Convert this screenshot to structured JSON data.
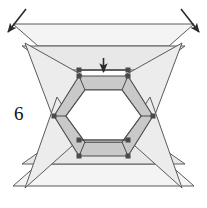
{
  "figure": {
    "label": "6",
    "colors": {
      "background": "#ffffff",
      "stroke": "#555555",
      "stroke_dark": "#3a3a3a",
      "fill_light": "#ebebeb",
      "fill_mid": "#d9d9d9",
      "fill_band": "#c9c9c9",
      "fill_white": "#ffffff",
      "arrow": "#2b2b2b",
      "vertex": "#4a4a4a",
      "label": "#111111"
    },
    "annotations": {
      "arrow_down": "down-arrow",
      "arrow_top_left": "diagonal-arrow-down-left",
      "arrow_top_right": "diagonal-arrow-down-right"
    },
    "geometry": {
      "outer_top_band": {
        "name": "top-outer-trapezoid-band",
        "points": "13,24 194,24 169,46 38,46",
        "fill": "#f2f2f2"
      },
      "top_band": {
        "name": "top-trapezoid-band",
        "points": "22,46 185,46 151,70 56,70",
        "fill": "#e6e6e6"
      },
      "outer_bottom_band": {
        "name": "bottom-outer-trapezoid-band",
        "points": "13,186 194,186 169,164 38,164",
        "fill": "#f2f2f2"
      },
      "bottom_band": {
        "name": "bottom-trapezoid-band",
        "points": "22,164 185,164 151,140 56,140",
        "fill": "#e6e6e6"
      },
      "left_wing_upper": {
        "name": "left-wing-upper-triangle",
        "points": "25,43 81,74 57,128",
        "fill": "#ececec"
      },
      "left_wing_lower": {
        "name": "left-wing-lower-triangle",
        "points": "25,188 81,136 57,92",
        "fill": "#ececec"
      },
      "right_wing_upper": {
        "name": "right-wing-upper-triangle",
        "points": "182,43 126,74 150,128",
        "fill": "#ececec"
      },
      "right_wing_lower": {
        "name": "right-wing-lower-triangle",
        "points": "182,188 126,136 150,92",
        "fill": "#ececec"
      },
      "hex_outer": {
        "name": "hexagon-outer-ring",
        "points": "79,76 128,76 153,116 128,156 79,156 54,116"
      },
      "hex_inner": {
        "name": "hexagon-inner-hole",
        "points": "85,90 122,90 141,116 122,142 85,142 66,116",
        "fill": "#ffffff"
      },
      "vertices": [
        {
          "name": "vertex-top-left-inner",
          "x": 79,
          "y": 70
        },
        {
          "name": "vertex-top-right-inner",
          "x": 128,
          "y": 70
        },
        {
          "name": "vertex-top-left-hex",
          "x": 79,
          "y": 76
        },
        {
          "name": "vertex-top-right-hex",
          "x": 128,
          "y": 76
        },
        {
          "name": "vertex-left-hex",
          "x": 54,
          "y": 116
        },
        {
          "name": "vertex-right-hex",
          "x": 153,
          "y": 116
        },
        {
          "name": "vertex-bottom-left-hex",
          "x": 79,
          "y": 156
        },
        {
          "name": "vertex-bottom-right-hex",
          "x": 128,
          "y": 156
        }
      ]
    }
  }
}
